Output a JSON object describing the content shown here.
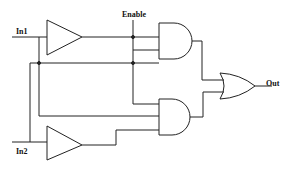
{
  "diagram": {
    "type": "logic-circuit",
    "labels": {
      "in1": "In1",
      "in2": "In2",
      "enable": "Enable",
      "out": "Out"
    },
    "components": [
      {
        "id": "buffer1",
        "type": "buffer",
        "input": "In1"
      },
      {
        "id": "buffer2",
        "type": "buffer",
        "input": "In2"
      },
      {
        "id": "and1",
        "type": "AND",
        "inputs": [
          "buffer1",
          "Enable",
          "In2"
        ]
      },
      {
        "id": "and2",
        "type": "AND",
        "inputs": [
          "Enable",
          "In1",
          "buffer2"
        ]
      },
      {
        "id": "or1",
        "type": "OR",
        "inputs": [
          "and1",
          "and2"
        ],
        "output": "Out"
      }
    ],
    "colors": {
      "line": "#222222",
      "background": "#ffffff"
    }
  }
}
